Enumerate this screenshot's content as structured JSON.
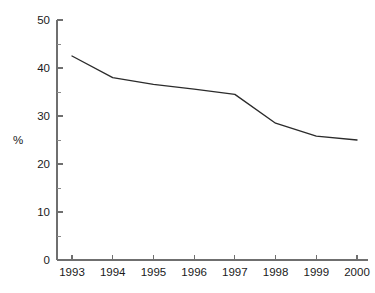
{
  "chart_data": {
    "type": "line",
    "title": "",
    "subtitle": "",
    "xlabel": "",
    "ylabel": "%",
    "categories": [
      "1993",
      "1994",
      "1995",
      "1996",
      "1997",
      "1998",
      "1999",
      "2000"
    ],
    "x": [
      1993,
      1994,
      1995,
      1996,
      1997,
      1998,
      1999,
      2000
    ],
    "values": [
      42.5,
      38.0,
      36.6,
      35.6,
      34.5,
      28.5,
      25.8,
      25.0
    ],
    "series": [
      {
        "name": "",
        "values": [
          42.5,
          38.0,
          36.6,
          35.6,
          34.5,
          28.5,
          25.8,
          25.0
        ]
      }
    ],
    "ylim": [
      0,
      50
    ],
    "xlim": [
      1993,
      2000
    ],
    "y_ticks": [
      0,
      10,
      20,
      30,
      40,
      50
    ],
    "y_tick_labels": [
      "0",
      "10",
      "20",
      "30",
      "40",
      "50"
    ],
    "y_minor_ticks": [
      5,
      15,
      25,
      35,
      45
    ],
    "x_ticks": [
      1993,
      1994,
      1995,
      1996,
      1997,
      1998,
      1999,
      2000
    ],
    "x_tick_labels": [
      "1993",
      "1994",
      "1995",
      "1996",
      "1997",
      "1998",
      "1999",
      "2000"
    ],
    "grid": false,
    "legend": false,
    "legend_position": "none",
    "annotations": [],
    "line_color": "#2b2b2b",
    "axis_color": "#6f6f6f",
    "background_color": "#ffffff"
  }
}
